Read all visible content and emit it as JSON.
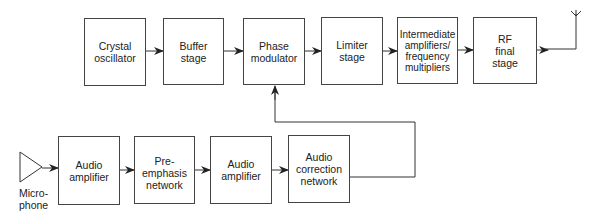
{
  "diagram": {
    "title": "",
    "type": "block-diagram",
    "top_row": [
      {
        "id": "crystal",
        "label": "Crystal\noscillator"
      },
      {
        "id": "buffer",
        "label": "Buffer\nstage"
      },
      {
        "id": "phase",
        "label": "Phase\nmodulator"
      },
      {
        "id": "limiter",
        "label": "Limiter\nstage"
      },
      {
        "id": "intermediate",
        "label": "Intermediate\namplifiers/\nfrequency\nmultipliers"
      },
      {
        "id": "rf",
        "label": "RF\nfinal\nstage"
      }
    ],
    "bottom_row": [
      {
        "id": "audio1",
        "label": "Audio\namplifier"
      },
      {
        "id": "preemph",
        "label": "Pre-emphasis\nnetwork"
      },
      {
        "id": "audio2",
        "label": "Audio\namplifier"
      },
      {
        "id": "correction",
        "label": "Audio\ncorrection\nnetwork"
      }
    ],
    "microphone_label": "Micro-\nphone",
    "antenna": "antenna-icon",
    "edges": [
      [
        "crystal",
        "buffer"
      ],
      [
        "buffer",
        "phase"
      ],
      [
        "phase",
        "limiter"
      ],
      [
        "limiter",
        "intermediate"
      ],
      [
        "intermediate",
        "rf"
      ],
      [
        "rf",
        "antenna"
      ],
      [
        "microphone",
        "audio1"
      ],
      [
        "audio1",
        "preemph"
      ],
      [
        "preemph",
        "audio2"
      ],
      [
        "audio2",
        "correction"
      ],
      [
        "correction",
        "phase"
      ]
    ]
  }
}
